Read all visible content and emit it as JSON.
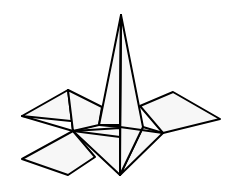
{
  "figure": {
    "colors": {
      "stroke": "#000000",
      "fill": "#f7f7f7",
      "background": "#ffffff"
    },
    "faces": [
      {
        "name": "left-rhombus",
        "points": "22,116 68,90 73,131 100,124"
      },
      {
        "name": "left-rhombus-inner",
        "points": "68,90 102,107 99,125 73,131"
      },
      {
        "name": "right-rhombus",
        "points": "140,106 173,92 220,119 163,133"
      },
      {
        "name": "bottom-left-rhombus",
        "points": "22,159 73,131 95,157 68,175"
      },
      {
        "name": "bottom-center-face",
        "points": "73,131 120,128 120,175"
      },
      {
        "name": "bottom-right-face",
        "points": "143,127 163,133 120,175"
      },
      {
        "name": "spike-left",
        "points": "121,15 99,125 120,127"
      },
      {
        "name": "spike-right",
        "points": "121,15 143,127 120,175 120,127"
      }
    ],
    "edges": [
      {
        "name": "crease-left",
        "d": "M73,131 L120,137"
      },
      {
        "name": "crease-right",
        "d": "M120,127 L163,133"
      },
      {
        "name": "crease-center",
        "d": "M99,125 L120,125"
      },
      {
        "name": "left-rhombus-lower",
        "d": "M22,116 L73,131"
      },
      {
        "name": "center-vertical",
        "d": "M121,15 L120,175"
      }
    ]
  }
}
